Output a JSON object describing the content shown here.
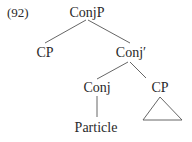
{
  "example_number": "(92)",
  "tree": {
    "root": {
      "label": "ConjP",
      "children": [
        {
          "label": "CP"
        },
        {
          "label": "Conj′",
          "children": [
            {
              "label": "Conj",
              "children": [
                {
                  "label": "Particle"
                }
              ]
            },
            {
              "label": "CP",
              "collapsed_triangle": true
            }
          ]
        }
      ]
    }
  },
  "nodes": {
    "conjp": "ConjP",
    "cp_left": "CP",
    "conj_bar": "Conj′",
    "conj": "Conj",
    "cp_right": "CP",
    "particle": "Particle"
  }
}
